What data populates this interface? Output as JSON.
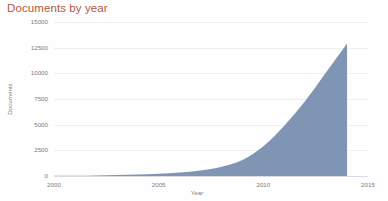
{
  "chart_data": {
    "type": "area",
    "title": "Documents by year",
    "xlabel": "Year",
    "ylabel": "Documents",
    "xlim": [
      2000,
      2015
    ],
    "ylim": [
      0,
      15000
    ],
    "grid": true,
    "legend": "none",
    "xticks": [
      "2000",
      "2005",
      "2010",
      "2015"
    ],
    "xtick_values": [
      2000,
      2005,
      2010,
      2015
    ],
    "yticks": [
      "0",
      "2500",
      "5000",
      "7500",
      "10000",
      "12500",
      "15000"
    ],
    "ytick_values": [
      0,
      2500,
      5000,
      7500,
      10000,
      12500,
      15000
    ],
    "series": [
      {
        "name": "Documents",
        "fill_color": "#7f95b3",
        "x": [
          2000,
          2001,
          2002,
          2003,
          2004,
          2005,
          2006,
          2007,
          2008,
          2009,
          2010,
          2011,
          2012,
          2013,
          2014
        ],
        "values": [
          20,
          35,
          60,
          95,
          140,
          210,
          330,
          540,
          900,
          1550,
          2900,
          4900,
          7300,
          10100,
          12900
        ]
      }
    ],
    "colors": {
      "title": "#b5553f",
      "area_fill": "#7f95b3",
      "tick_text": "#7c7c7c",
      "gridline": "#eceef1",
      "baseline": "#d9dde3",
      "background": "#fefefe"
    }
  }
}
